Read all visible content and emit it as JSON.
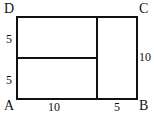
{
  "diagram": {
    "vertices": {
      "A": "A",
      "B": "B",
      "C": "C",
      "D": "D"
    },
    "dimensions": {
      "left_upper": "5",
      "left_lower": "5",
      "bottom_left": "10",
      "bottom_right": "5",
      "right": "10"
    }
  }
}
